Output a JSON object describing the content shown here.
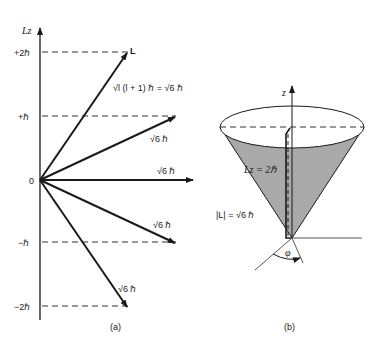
{
  "panel_a": {
    "caption": "(a)",
    "axis_label": "Lz",
    "levels": [
      {
        "label": "+2ℏ",
        "value": 2
      },
      {
        "label": "+ℏ",
        "value": 1
      },
      {
        "label": "0",
        "value": 0
      },
      {
        "label": "−ℏ",
        "value": -1
      },
      {
        "label": "−2ℏ",
        "value": -2
      }
    ],
    "vector_label_L": "L",
    "magnitude_eq": "√l (l + 1) ℏ = √6 ℏ",
    "vector_labels": [
      "√6 ℏ",
      "√6 ℏ",
      "√6 ℏ",
      "√6 ℏ"
    ]
  },
  "panel_b": {
    "caption": "(b)",
    "axis_label": "z",
    "lz_label": "Lz = 2ℏ",
    "magnitude_label": "|L| = √6 ℏ",
    "angle_label": "φ"
  },
  "colors": {
    "ink": "#1a1a1a",
    "cone_fill": "#a9a9a9",
    "dash": "#333333"
  }
}
